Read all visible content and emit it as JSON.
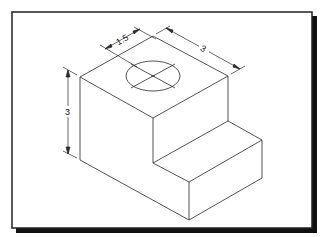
{
  "diagram": {
    "type": "isometric technical drawing",
    "colors": {
      "line": "#2a2a2a",
      "background": "#ffffff",
      "frame": "#222222",
      "shadow": "#111111"
    },
    "dimensions": {
      "hole_offset": "1.5",
      "depth": "3",
      "height": "3"
    }
  }
}
